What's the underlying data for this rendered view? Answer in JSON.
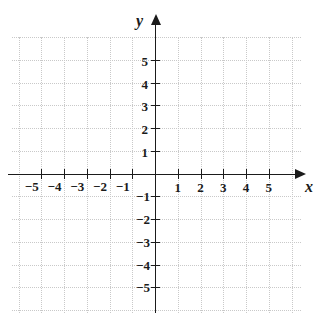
{
  "chart_data": {
    "type": "scatter",
    "title": "",
    "subtitle": "",
    "xlabel": "x",
    "ylabel": "y",
    "xlim": [
      -6.4,
      6.4
    ],
    "ylim": [
      -6.1,
      6.0
    ],
    "xticks": [
      -5,
      -4,
      -3,
      -2,
      -1,
      1,
      2,
      3,
      4,
      5
    ],
    "yticks": [
      5,
      4,
      3,
      2,
      1,
      -1,
      -2,
      -3,
      -4,
      -5
    ],
    "xticklabels": [
      "−5",
      "−4",
      "−3",
      "−2",
      "−1",
      "1",
      "2",
      "3",
      "4",
      "5"
    ],
    "yticklabels": [
      "5",
      "4",
      "3",
      "2",
      "1",
      "−1",
      "−2",
      "−3",
      "−4",
      "−5"
    ],
    "grid": true,
    "grid_style": "dotted",
    "grid_color": "#c9c9c9",
    "grid_spacing": 1,
    "axis_color": "#1b1b1b",
    "background": "#ffffff",
    "legend": null,
    "series": [],
    "values": [],
    "annotations": [],
    "arrows": [
      "x-positive",
      "y-positive"
    ]
  },
  "axes": {
    "x_name": "x",
    "y_name": "y"
  },
  "labels": {
    "x_negative": [
      "−5",
      "−4",
      "−3",
      "−2",
      "−1"
    ],
    "x_positive": [
      "1",
      "2",
      "3",
      "4",
      "5"
    ],
    "y_positive": [
      "5",
      "4",
      "3",
      "2",
      "1"
    ],
    "y_negative": [
      "−1",
      "−2",
      "−3",
      "−4",
      "−5"
    ]
  }
}
